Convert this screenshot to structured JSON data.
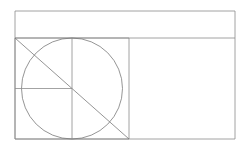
{
  "canvas": {
    "width": 248,
    "height": 148,
    "background_color": "#ffffff",
    "title": "geometric-construction-diagram"
  },
  "style": {
    "stroke_color": "#8c8c8c",
    "stroke_color_dark": "#7a7a7a",
    "stroke_width": 0.8,
    "fill": "none"
  },
  "shapes": {
    "outer_rectangle": {
      "label": "outer-rectangle",
      "x": 15,
      "y": 11,
      "width": 220,
      "height": 128,
      "stroke": "#8c8c8c"
    },
    "inner_square": {
      "label": "inner-square",
      "x": 15,
      "y": 38,
      "width": 114,
      "height": 101,
      "stroke": "#8c8c8c"
    },
    "inscribed_circle": {
      "label": "inscribed-circle",
      "cx": 72,
      "cy": 88.5,
      "r": 50.5,
      "stroke": "#7a7a7a"
    },
    "diagonal_line": {
      "label": "square-diagonal",
      "x1": 15,
      "y1": 38,
      "x2": 129,
      "y2": 139,
      "stroke": "#7a7a7a"
    },
    "horizontal_radius_line": {
      "label": "horizontal-radius",
      "x1": 15,
      "y1": 88.5,
      "x2": 72,
      "y2": 88.5,
      "stroke": "#8c8c8c"
    },
    "vertical_axis_line": {
      "label": "vertical-axis",
      "x1": 72,
      "y1": 38,
      "x2": 72,
      "y2": 139,
      "stroke": "#8c8c8c"
    },
    "top_divider_line": {
      "label": "top-divider",
      "x1": 15,
      "y1": 38,
      "x2": 235,
      "y2": 38,
      "stroke": "#8c8c8c"
    }
  }
}
